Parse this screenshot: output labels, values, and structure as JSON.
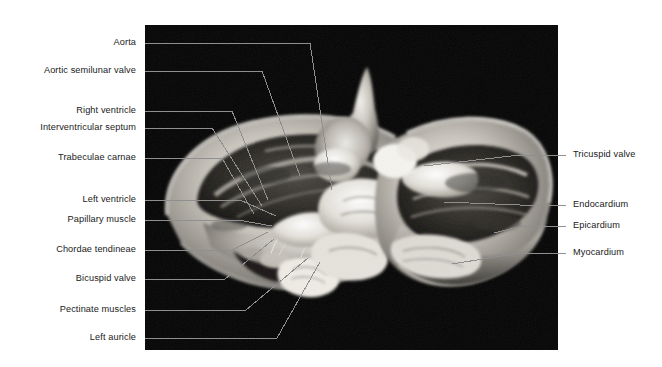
{
  "figure": {
    "photo": {
      "background_color": "#050505",
      "x": 145,
      "y": 25,
      "width": 413,
      "height": 325
    },
    "style": {
      "leader_color": "#8f8f8f",
      "text_color": "#1a1a1a",
      "page_background": "#ffffff"
    }
  },
  "labels_left": [
    {
      "text": "Aorta",
      "text_x": 136,
      "text_y": 37,
      "line": "145,43 310,43 332,190"
    },
    {
      "text": "Aortic semilunar valve",
      "text_x": 136,
      "text_y": 65,
      "line": "145,71 262,71 300,176"
    },
    {
      "text": "Right ventricle",
      "text_x": 136,
      "text_y": 105,
      "line": "145,111 232,111 268,200"
    },
    {
      "text": "Interventricular septum",
      "text_x": 136,
      "text_y": 122,
      "line": "145,128 212,128 262,206"
    },
    {
      "text": "Trabeculae carnae",
      "text_x": 136,
      "text_y": 152,
      "line": "145,158 222,158 254,214"
    },
    {
      "text": "Left ventricle",
      "text_x": 136,
      "text_y": 194,
      "line": "145,200 240,200 276,216"
    },
    {
      "text": "Papillary muscle",
      "text_x": 136,
      "text_y": 214,
      "line": "145,220 238,220 272,226"
    },
    {
      "text": "Chordae tendineae",
      "text_x": 136,
      "text_y": 244,
      "line": "145,250 232,250 268,232"
    },
    {
      "text": "Bicuspid valve",
      "text_x": 136,
      "text_y": 273,
      "line": "145,279 225,279 274,239"
    },
    {
      "text": "Pectinate muscles",
      "text_x": 136,
      "text_y": 304,
      "line": "145,310 246,310 308,258"
    },
    {
      "text": "Left auricle",
      "text_x": 136,
      "text_y": 332,
      "line": "145,338 277,338 320,262"
    }
  ],
  "labels_right": [
    {
      "text": "Tricuspid valve",
      "text_x": 573,
      "text_y": 149,
      "line": "566,155 520,155 424,166"
    },
    {
      "text": "Endocardium",
      "text_x": 573,
      "text_y": 199,
      "line": "566,205 520,205 444,202"
    },
    {
      "text": "Epicardium",
      "text_x": 573,
      "text_y": 220,
      "line": "566,226 522,226 494,233"
    },
    {
      "text": "Myocardium",
      "text_x": 573,
      "text_y": 247,
      "line": "566,253 520,253 452,264"
    }
  ]
}
